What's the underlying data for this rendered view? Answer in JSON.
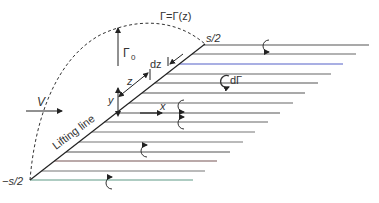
{
  "diagram": {
    "type": "lifting-line-horseshoe-vortex",
    "labels": {
      "gamma_distribution": "Γ=Γ(z)",
      "gamma0": "Γ",
      "gamma0_sub": "0",
      "half_span_pos": "s/2",
      "half_span_neg": "−s/2",
      "lifting_line": "Lifting line",
      "freestream": "V",
      "z_axis": "z",
      "y_axis": "y",
      "x_axis": "x",
      "dz": "dz",
      "dgamma": "dΓ"
    },
    "colors": {
      "line": "#444444",
      "dashed": "#333333",
      "blue_line": "#5560c8",
      "green_line": "#5f9a85",
      "text": "#333333"
    },
    "trailing_lines": [
      {
        "y": 45,
        "x_end": 369,
        "color": "#555555"
      },
      {
        "y": 54,
        "x_end": 356,
        "color": "#666666"
      },
      {
        "y": 64,
        "x_end": 343,
        "color": "#5560c8"
      },
      {
        "y": 74,
        "x_end": 331,
        "color": "#666666"
      },
      {
        "y": 83,
        "x_end": 318,
        "color": "#555555"
      },
      {
        "y": 93,
        "x_end": 305,
        "color": "#555555"
      },
      {
        "y": 103,
        "x_end": 293,
        "color": "#666666"
      },
      {
        "y": 113,
        "x_end": 280,
        "color": "#555555"
      },
      {
        "y": 122,
        "x_end": 268,
        "color": "#666666"
      },
      {
        "y": 132,
        "x_end": 255,
        "color": "#777777"
      },
      {
        "y": 142,
        "x_end": 243,
        "color": "#777777"
      },
      {
        "y": 152,
        "x_end": 230,
        "color": "#555555"
      },
      {
        "y": 161,
        "x_end": 217,
        "color": "#775555"
      },
      {
        "y": 171,
        "x_end": 205,
        "color": "#777777"
      },
      {
        "y": 180,
        "x_end": 193,
        "color": "#5f9a85"
      }
    ]
  }
}
